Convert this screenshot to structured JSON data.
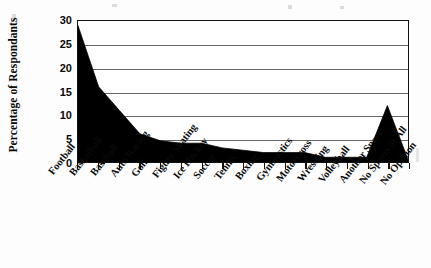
{
  "chart_data": {
    "type": "area",
    "title": "",
    "subtitle": "",
    "xlabel": "",
    "ylabel": "Percentage of Respondants",
    "ylim": [
      0,
      30
    ],
    "yticks": [
      0,
      5,
      10,
      15,
      20,
      25,
      30
    ],
    "grid": true,
    "legend": false,
    "fill_color": "#000000",
    "categories": [
      "Football",
      "Basketball",
      "Baseball",
      "Auto Racing",
      "Golf",
      "Figure Skating",
      "Ice Hockey",
      "Soccer",
      "Tennis",
      "Boxing",
      "Gymnastics",
      "Motorcross",
      "Wrestling",
      "Volleyball",
      "Another Sport",
      "No Sports at All",
      "No Opinion"
    ],
    "values": [
      29,
      16,
      11,
      6,
      4.5,
      4,
      4,
      3,
      2.5,
      2,
      2,
      2,
      1,
      1,
      1,
      12,
      0.5
    ]
  },
  "axis": {
    "y_title": "Percentage of Respondants",
    "y_tick_labels": [
      "30",
      "25",
      "20",
      "15",
      "10",
      "5",
      "0"
    ]
  }
}
